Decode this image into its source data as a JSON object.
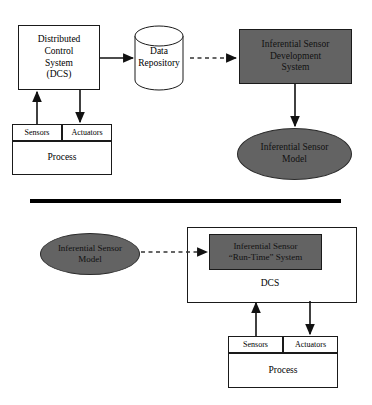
{
  "diagram": {
    "colors": {
      "gray_fill": "#636363",
      "stroke": "#1a1a1a",
      "background": "#ffffff",
      "divider": "#000000"
    },
    "divider": {
      "name": "section-divider-bar",
      "x": 30,
      "y": 199,
      "width": 311,
      "height": 4
    },
    "top_section": {
      "dcs_box": {
        "lines": [
          "Distributed",
          "Control",
          "System",
          "(DCS)"
        ],
        "x": 18,
        "y": 25,
        "width": 82,
        "height": 65
      },
      "sensors_cell": {
        "label": "Sensors",
        "x": 12,
        "y": 124,
        "width": 50,
        "height": 17
      },
      "actuators_cell": {
        "label": "Actuators",
        "x": 62,
        "y": 124,
        "width": 50,
        "height": 17
      },
      "process_box": {
        "label": "Process",
        "x": 12,
        "y": 141,
        "width": 100,
        "height": 34
      },
      "data_repository": {
        "lines": [
          "Data",
          "Repository"
        ],
        "x": 135,
        "y": 26,
        "width": 48,
        "height": 64
      },
      "development_system": {
        "lines": [
          "Inferential Sensor",
          "Development",
          "System"
        ],
        "x": 239,
        "y": 29,
        "width": 113,
        "height": 55
      },
      "sensor_model": {
        "lines": [
          "Inferential Sensor",
          "Model"
        ],
        "x": 237,
        "y": 128,
        "width": 115,
        "height": 52
      }
    },
    "bottom_section": {
      "sensor_model": {
        "lines": [
          "Inferential Sensor",
          "Model"
        ],
        "x": 40,
        "y": 233,
        "width": 100,
        "height": 42
      },
      "dcs_container": {
        "label": "DCS",
        "x": 187,
        "y": 227,
        "width": 168,
        "height": 74
      },
      "runtime_system": {
        "lines": [
          "Inferential Sensor",
          "“Run-Time” System"
        ],
        "x": 209,
        "y": 234,
        "width": 113,
        "height": 36
      },
      "sensors_cell": {
        "label": "Sensors",
        "x": 228,
        "y": 336,
        "width": 55,
        "height": 17
      },
      "actuators_cell": {
        "label": "Actuators",
        "x": 283,
        "y": 336,
        "width": 55,
        "height": 17
      },
      "process_box": {
        "label": "Process",
        "x": 228,
        "y": 353,
        "width": 110,
        "height": 35
      }
    },
    "connectors": [
      {
        "name": "arrow-dcs-to-repository",
        "style": "solid",
        "from": [
          100,
          58
        ],
        "to": [
          135,
          58
        ]
      },
      {
        "name": "arrow-repository-to-development-system",
        "style": "dashed",
        "from": [
          190,
          58
        ],
        "to": [
          238,
          58
        ]
      },
      {
        "name": "arrow-sensors-to-dcs",
        "style": "solid",
        "from": [
          37,
          124
        ],
        "to": [
          37,
          90
        ]
      },
      {
        "name": "arrow-dcs-to-actuators",
        "style": "solid",
        "from": [
          80,
          90
        ],
        "to": [
          80,
          124
        ]
      },
      {
        "name": "arrow-development-system-to-model",
        "style": "solid",
        "from": [
          295,
          84
        ],
        "to": [
          295,
          128
        ]
      },
      {
        "name": "arrow-model-to-runtime-system",
        "style": "dashed",
        "from": [
          140,
          252
        ],
        "to": [
          209,
          252
        ]
      },
      {
        "name": "arrow-sensors-to-dcs-bottom",
        "style": "solid",
        "from": [
          256,
          336
        ],
        "to": [
          256,
          301
        ]
      },
      {
        "name": "arrow-dcs-to-actuators-bottom",
        "style": "solid",
        "from": [
          310,
          301
        ],
        "to": [
          310,
          336
        ]
      }
    ]
  }
}
